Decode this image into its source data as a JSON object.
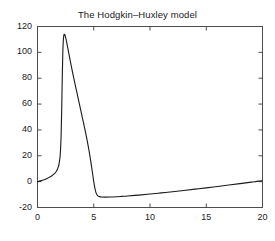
{
  "figure": {
    "background_color": "#ffffff",
    "axes_color": "#4d4d4d",
    "line_color": "#1a1a1a",
    "text_color": "#1a1a1a"
  },
  "chart_data": {
    "type": "line",
    "title": "The Hodgkin–Huxley model",
    "xlabel": "",
    "ylabel": "",
    "xlim": [
      0,
      20
    ],
    "ylim": [
      -20,
      120
    ],
    "grid": false,
    "legend": null,
    "xticks": [
      0,
      5,
      10,
      15,
      20
    ],
    "xtick_labels": [
      "0",
      "5",
      "10",
      "15",
      "20"
    ],
    "yticks": [
      -20,
      0,
      20,
      40,
      60,
      80,
      100,
      120
    ],
    "ytick_labels": [
      "-20",
      "0",
      "20",
      "40",
      "60",
      "80",
      "100",
      "120"
    ],
    "series": [
      {
        "name": "membrane potential",
        "x": [
          0.0,
          0.25,
          0.5,
          0.75,
          1.0,
          1.25,
          1.5,
          1.65,
          1.8,
          1.9,
          2.0,
          2.05,
          2.1,
          2.15,
          2.2,
          2.25,
          2.3,
          2.35,
          2.4,
          2.45,
          2.5,
          2.6,
          2.7,
          2.8,
          2.9,
          3.0,
          3.2,
          3.4,
          3.6,
          3.8,
          4.0,
          4.2,
          4.4,
          4.6,
          4.8,
          5.0,
          5.1,
          5.2,
          5.3,
          5.4,
          5.5,
          5.7,
          6.0,
          6.5,
          7.0,
          7.5,
          8.0,
          9.0,
          10.0,
          11.0,
          12.0,
          13.0,
          14.0,
          15.0,
          16.0,
          17.0,
          18.0,
          19.0,
          19.5,
          20.0
        ],
        "y": [
          0.0,
          0.6,
          1.3,
          2.1,
          3.1,
          4.4,
          6.2,
          7.7,
          10.2,
          13.0,
          19.0,
          25.0,
          36.0,
          55.0,
          80.0,
          100.0,
          110.0,
          113.5,
          114.0,
          113.2,
          111.5,
          107.5,
          103.0,
          98.5,
          94.0,
          89.5,
          81.0,
          73.0,
          65.0,
          57.0,
          49.0,
          41.0,
          32.5,
          23.0,
          12.0,
          0.0,
          -5.0,
          -8.5,
          -10.3,
          -11.2,
          -11.6,
          -11.9,
          -12.0,
          -11.9,
          -11.7,
          -11.4,
          -11.1,
          -10.4,
          -9.6,
          -8.7,
          -7.8,
          -6.8,
          -5.8,
          -4.8,
          -3.7,
          -2.6,
          -1.5,
          -0.4,
          0.2,
          0.7
        ]
      }
    ],
    "annotations": []
  }
}
